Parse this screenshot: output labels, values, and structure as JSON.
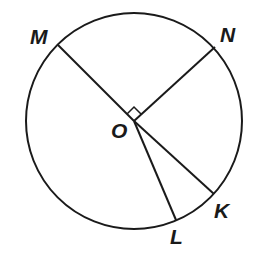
{
  "diagram": {
    "type": "circle-geometry",
    "stroke_color": "#1a1a1a",
    "circle": {
      "center": "O",
      "cx": 134,
      "cy": 121,
      "r": 108
    },
    "points": {
      "O": {
        "label": "O",
        "x": 134,
        "y": 121
      },
      "M": {
        "label": "M",
        "x": 58,
        "y": 45
      },
      "N": {
        "label": "N",
        "x": 215,
        "y": 47
      },
      "K": {
        "label": "K",
        "x": 214,
        "y": 194
      },
      "L": {
        "label": "L",
        "x": 176,
        "y": 220
      }
    },
    "segments": [
      "OM",
      "ON",
      "OK",
      "OL"
    ],
    "right_angle_marker": {
      "at": "O",
      "between": [
        "OM",
        "ON"
      ]
    }
  }
}
